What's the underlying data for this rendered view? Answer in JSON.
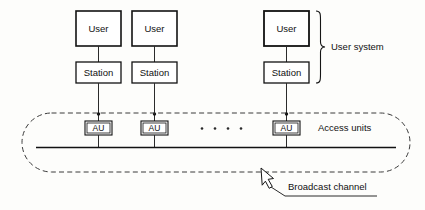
{
  "diagram": {
    "columns": [
      {
        "id": "col-1",
        "user_label": "User",
        "station_label": "Station",
        "au_label": "AU"
      },
      {
        "id": "col-2",
        "user_label": "User",
        "station_label": "Station",
        "au_label": "AU"
      },
      {
        "id": "col-3",
        "user_label": "User",
        "station_label": "Station",
        "au_label": "AU"
      }
    ],
    "annotations": {
      "user_system": "User system",
      "access_units": "Access units",
      "broadcast_channel": "Broadcast channel"
    },
    "ellipsis": {
      "symbol": ".",
      "count": 4
    },
    "colors": {
      "stroke": "#121212",
      "dashed_stroke": "#3a3a3a",
      "background": "#fdfdfb",
      "box_fill": "#ffffff"
    }
  }
}
